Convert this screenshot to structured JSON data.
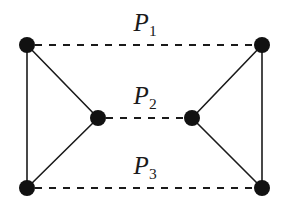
{
  "figure": {
    "background_color": "#ffffff",
    "ink_color": "#1a1a1a",
    "node_color": "#111111",
    "width": 290,
    "height": 206
  },
  "labels": [
    {
      "id": "P1",
      "base": "P",
      "sub": "1",
      "x": 145,
      "y": 22
    },
    {
      "id": "P2",
      "base": "P",
      "sub": "2",
      "x": 145,
      "y": 95
    },
    {
      "id": "P3",
      "base": "P",
      "sub": "3",
      "x": 145,
      "y": 165
    }
  ],
  "chart_data": {
    "type": "diagram",
    "title": "",
    "nodes": [
      {
        "id": "top-left",
        "x": 27,
        "y": 45,
        "r": 8
      },
      {
        "id": "top-right",
        "x": 262,
        "y": 45,
        "r": 8
      },
      {
        "id": "middle-left",
        "x": 98,
        "y": 118,
        "r": 8
      },
      {
        "id": "middle-right",
        "x": 192,
        "y": 118,
        "r": 8
      },
      {
        "id": "bottom-left",
        "x": 27,
        "y": 188,
        "r": 8
      },
      {
        "id": "bottom-right",
        "x": 262,
        "y": 188,
        "r": 8
      }
    ],
    "solid_edges": [
      {
        "from": "top-left",
        "to": "bottom-left"
      },
      {
        "from": "top-right",
        "to": "bottom-right"
      },
      {
        "from": "top-left",
        "to": "middle-left"
      },
      {
        "from": "bottom-left",
        "to": "middle-left"
      },
      {
        "from": "top-right",
        "to": "middle-right"
      },
      {
        "from": "bottom-right",
        "to": "middle-right"
      }
    ],
    "dashed_edges": [
      {
        "id": "P1",
        "from": "top-left",
        "to": "top-right",
        "label": "P1"
      },
      {
        "id": "P2",
        "from": "middle-left",
        "to": "middle-right",
        "label": "P2"
      },
      {
        "id": "P3",
        "from": "bottom-left",
        "to": "bottom-right",
        "label": "P3"
      }
    ],
    "dash_pattern": "7 7",
    "edge_width": 1.6,
    "legend": [],
    "annotations": [
      "P1",
      "P2",
      "P3"
    ]
  }
}
